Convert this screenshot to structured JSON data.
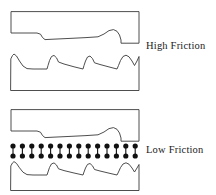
{
  "figure": {
    "background_color": "#ffffff",
    "stroke_color": "#3a3a3a",
    "dot_color": "#111111",
    "width": 216,
    "height": 195
  },
  "labels": {
    "high_friction": "High Friction",
    "low_friction": "Low Friction",
    "text_color": "#1a1a1a"
  },
  "panels": [
    {
      "id": "high-friction-upper-block",
      "name": "upper-surface-block-high-friction",
      "role": "upper solid block with rough lower face",
      "box": {
        "x": 11,
        "y": 10,
        "width": 130,
        "height": 36
      },
      "outline_path": "M 11 12 L 11 33 L 37 33 L 41 35 L 43 39 L 46 41 L 99 37 L 107 32 L 113 30 L 118 32 L 121 37 L 121 43 L 139 43 L 139 12 Z"
    },
    {
      "id": "high-friction-lower-block",
      "name": "lower-surface-block-high-friction",
      "role": "lower solid block with rough upper face",
      "box": {
        "x": 11,
        "y": 53,
        "width": 130,
        "height": 38
      },
      "outline_path": "M 11 91 L 139 91 L 139 57 L 136 61 L 133 66 L 130 62 L 127 58 L 124 57 L 121 60 L 119 65 L 117 69 L 95 62 L 93 58 L 90 56 L 87 58 L 85 63 L 84 68 L 60 62 L 57 57 L 54 55 L 51 57 L 49 62 L 47 68 L 35 69 L 28 69 L 23 66 L 19 60 L 16 55 L 14 54 L 11 57 Z"
    },
    {
      "id": "low-friction-upper-block",
      "name": "upper-surface-block-low-friction",
      "role": "upper solid block with rough lower face",
      "box": {
        "x": 11,
        "y": 108,
        "width": 130,
        "height": 36
      },
      "outline_path": "M 11 110 L 11 131 L 37 131 L 41 133 L 43 137 L 46 139 L 99 135 L 107 130 L 113 128 L 118 130 L 121 135 L 121 141 L 139 141 L 139 110 Z"
    },
    {
      "id": "low-friction-lower-block",
      "name": "lower-surface-block-low-friction",
      "role": "lower solid block with rough upper face",
      "box": {
        "x": 11,
        "y": 161,
        "width": 130,
        "height": 30
      },
      "outline_path": "M 11 191 L 139 191 L 139 165 L 136 169 L 133 173 L 130 169 L 127 165 L 124 164 L 121 167 L 119 171 L 117 175 L 95 169 L 93 165 L 90 163 L 87 165 L 85 169 L 84 174 L 60 169 L 57 165 L 54 163 L 51 165 L 49 169 L 47 174 L 35 175 L 28 175 L 23 172 L 19 167 L 16 163 L 14 162 L 11 165 Z"
    }
  ],
  "lubricant_layer": {
    "name": "lubricant-molecule-row",
    "description": "row of dumbbell shaped lubricant molecules between the two low friction blocks",
    "count": 14,
    "first_x": 13,
    "spacing": 9.4,
    "top_dot_y": 146,
    "bottom_dot_y": 156,
    "dot_radius": 2.6,
    "connector_width": 1.1
  }
}
